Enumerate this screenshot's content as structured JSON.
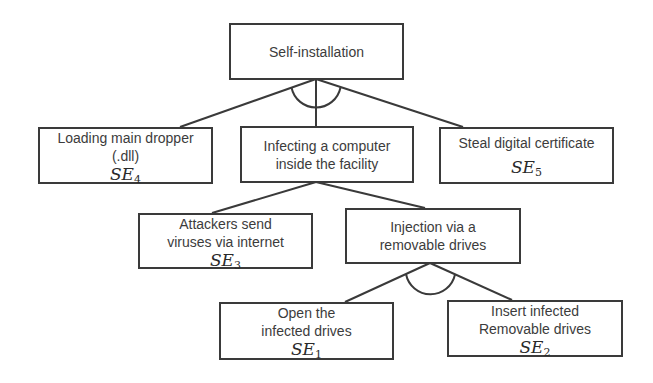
{
  "diagram": {
    "type": "attack-tree",
    "root": {
      "label": "Self-installation",
      "gate": "AND"
    },
    "level1": [
      {
        "label": "Loading main dropper\n(.dll)",
        "se_base": "SE",
        "se_sub": "4"
      },
      {
        "label": "Infecting a computer\ninside the facility",
        "gate": "OR"
      },
      {
        "label": "Steal digital certificate",
        "se_base": "SE",
        "se_sub": "5"
      }
    ],
    "level2": [
      {
        "label": "Attackers send\nviruses via internet",
        "se_base": "SE",
        "se_sub": "3"
      },
      {
        "label": "Injection via a\nremovable drives",
        "gate": "AND"
      }
    ],
    "level3": [
      {
        "label": "Open the\ninfected drives",
        "se_base": "SE",
        "se_sub": "1"
      },
      {
        "label": "Insert infected\nRemovable drives",
        "se_base": "SE",
        "se_sub": "2"
      }
    ],
    "colors": {
      "stroke": "#3a3a3a",
      "text": "#3c3c3c",
      "background": "#ffffff"
    }
  }
}
